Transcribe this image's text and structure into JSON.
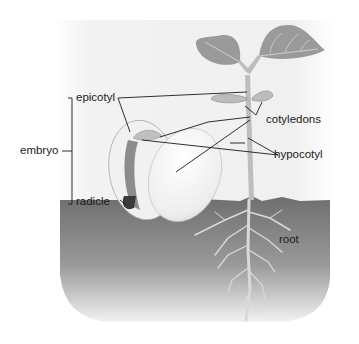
{
  "diagram": {
    "labels": {
      "epicotyl": "epicotyl",
      "embryo": "embryo",
      "radicle": "radicle",
      "cotyledons": "cotyledons",
      "hypocotyl": "hypocotyl",
      "root": "root"
    },
    "colors": {
      "background": "#ffffff",
      "sky_panel": "#eeeeee",
      "soil_top": "#6e6e6e",
      "soil_bottom": "#d8d8d8",
      "leaf": "#9a9a9a",
      "leaf_vein": "#d0d0d0",
      "stem": "#bdbdbd",
      "seed_coat": "#f4f4f4",
      "radicle_dark": "#3a3a3a",
      "leader_line": "#1a1a1a"
    }
  }
}
